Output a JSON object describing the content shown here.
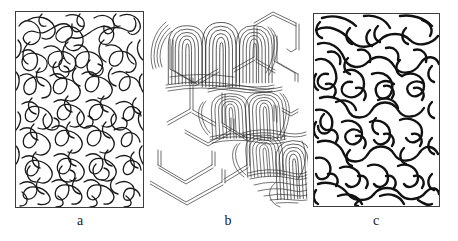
{
  "figure": {
    "type": "scientific-illustration",
    "background_color": "#ffffff",
    "ink_color": "#1a1a1a",
    "frame_color": "#3d3d3d",
    "panel_count": 3
  },
  "panels": [
    {
      "id": "a",
      "caption": "a",
      "framed": true,
      "description": "amorphous random-coil entangled chains",
      "stroke_width": 1.3,
      "x": 15,
      "y": 11,
      "width": 129,
      "height": 197
    },
    {
      "id": "b",
      "caption": "b",
      "framed": false,
      "description": "hexagonal lattice skeleton with diagonal band of folded-chain lamellae",
      "stroke_width": 0.7,
      "x": 150,
      "y": 5,
      "width": 158,
      "height": 203
    },
    {
      "id": "c",
      "caption": "c",
      "framed": true,
      "description": "semi-crystalline worm-like aligned domains",
      "stroke_width": 2.4,
      "x": 313,
      "y": 13,
      "width": 127,
      "height": 194
    }
  ],
  "captions": {
    "a": "a",
    "b": "b",
    "c": "c"
  }
}
